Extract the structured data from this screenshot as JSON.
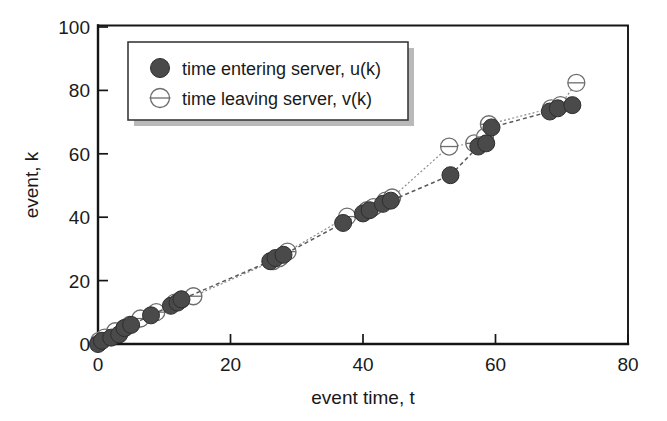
{
  "chart_data": {
    "type": "scatter",
    "title": "",
    "xlabel": "event time, t",
    "ylabel": "event, k",
    "xlim": [
      0,
      80
    ],
    "ylim": [
      0,
      100
    ],
    "xticks": [
      0,
      20,
      40,
      60,
      80
    ],
    "yticks": [
      0,
      20,
      40,
      60,
      80,
      100
    ],
    "grid": false,
    "legend_position": "upper-left-inside",
    "series": [
      {
        "name": "time entering server, u(k)",
        "marker": "filled-circle",
        "color": "#4a4a4a",
        "linestyle": "dashed",
        "x": [
          0.0,
          0.6,
          2.0,
          3.2,
          4.0,
          5.0,
          8.0,
          11.0,
          12.0,
          12.6,
          26.0,
          26.8,
          28.0,
          37.0,
          40.0,
          41.0,
          43.0,
          44.2,
          53.2,
          57.4,
          58.6,
          59.4,
          68.2,
          69.4,
          71.6
        ],
        "y": [
          0,
          1,
          2,
          3,
          5,
          6,
          9,
          12,
          13,
          14,
          26,
          27,
          28,
          38,
          41,
          42,
          44,
          45,
          53,
          62,
          63,
          68,
          73,
          74,
          75
        ]
      },
      {
        "name": "time leaving server, v(k)",
        "marker": "open-circle-barred",
        "color": "#6d6d6d",
        "linestyle": "dotted",
        "x": [
          0.2,
          1.0,
          2.6,
          4.0,
          4.8,
          6.4,
          8.8,
          11.6,
          12.6,
          14.4,
          26.4,
          27.4,
          28.6,
          37.6,
          40.6,
          41.6,
          43.4,
          44.4,
          53.0,
          56.8,
          58.4,
          59.0,
          68.4,
          69.8,
          72.2
        ],
        "y": [
          1,
          2,
          4,
          5,
          6,
          8,
          10,
          13,
          14,
          15,
          26,
          27,
          29,
          40,
          42,
          43,
          45,
          46,
          62,
          63,
          65,
          69,
          74,
          75,
          82
        ]
      }
    ]
  },
  "axes": {
    "x_tick_labels": [
      "0",
      "20",
      "40",
      "60",
      "80"
    ],
    "y_tick_labels": [
      "0",
      "20",
      "40",
      "60",
      "80",
      "100"
    ],
    "x_axis_title": "event time, t",
    "y_axis_title": "event, k"
  },
  "legend": {
    "entries": [
      {
        "label": "time entering server, u(k)",
        "marker": "filled-circle"
      },
      {
        "label": "time leaving server, v(k)",
        "marker": "open-circle-barred"
      }
    ]
  },
  "colors": {
    "series_u": "#4a4a4a",
    "series_v": "#6d6d6d",
    "axis": "#151515",
    "background": "#ffffff",
    "legend_shadow": "#b9b9b9"
  }
}
